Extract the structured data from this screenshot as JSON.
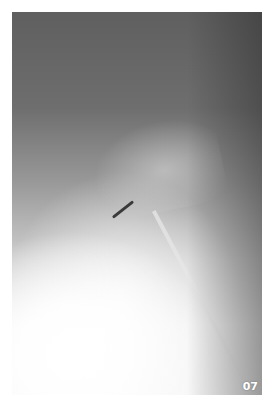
{
  "image": {
    "description": "Lateral spine radiograph (X-ray), grayscale",
    "corner_label": "07"
  }
}
